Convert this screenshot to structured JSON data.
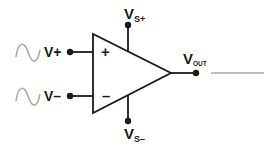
{
  "diagram": {
    "inputs": {
      "noninverting": {
        "label": "V+",
        "symbol": "+"
      },
      "inverting": {
        "label": "V–",
        "symbol": "–"
      }
    },
    "supply": {
      "positive": {
        "main": "V",
        "sub": "S+"
      },
      "negative": {
        "main": "V",
        "sub": "S–"
      }
    },
    "output": {
      "main": "V",
      "sub": "OUT"
    },
    "signals": {
      "input_waveform_icon": "sine-wave-icon",
      "output_line_icon": "flat-line-icon"
    },
    "colors": {
      "stroke": "#1a1a1a",
      "signal": "#aaaaaa",
      "background": "#ffffff"
    }
  }
}
